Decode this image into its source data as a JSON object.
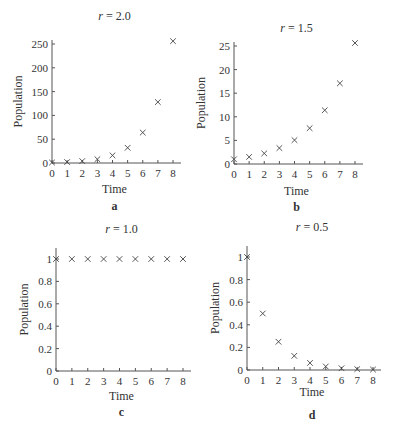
{
  "chart_data": [
    {
      "type": "scatter",
      "panel": "a",
      "title": "r = 2.0",
      "title_var": "r",
      "title_value": "= 2.0",
      "xlabel": "Time",
      "ylabel": "Population",
      "x": [
        0,
        1,
        2,
        3,
        4,
        5,
        6,
        7,
        8
      ],
      "values": [
        1,
        2,
        4,
        8,
        16,
        32,
        64,
        128,
        256
      ],
      "xticks": [
        "0",
        "1",
        "2",
        "3",
        "4",
        "5",
        "6",
        "7",
        "8"
      ],
      "yticks": [
        "0",
        "50",
        "100",
        "150",
        "200",
        "250"
      ],
      "xlim": [
        0,
        8.4
      ],
      "ylim": [
        0,
        260
      ],
      "marker": "x",
      "grid": false,
      "legend": false
    },
    {
      "type": "scatter",
      "panel": "b",
      "title": "r = 1.5",
      "title_var": "r",
      "title_value": "= 1.5",
      "xlabel": "Time",
      "ylabel": "Population",
      "x": [
        0,
        1,
        2,
        3,
        4,
        5,
        6,
        7,
        8
      ],
      "values": [
        1,
        1.5,
        2.25,
        3.375,
        5.06,
        7.59,
        11.39,
        17.09,
        25.63
      ],
      "xticks": [
        "0",
        "1",
        "2",
        "3",
        "4",
        "5",
        "6",
        "7",
        "8"
      ],
      "yticks": [
        "0",
        "5",
        "10",
        "15",
        "20",
        "25"
      ],
      "xlim": [
        0,
        8.4
      ],
      "ylim": [
        0,
        26
      ],
      "marker": "x",
      "grid": false,
      "legend": false
    },
    {
      "type": "scatter",
      "panel": "c",
      "title": "r = 1.0",
      "title_var": "r",
      "title_value": "= 1.0",
      "xlabel": "Time",
      "ylabel": "Population",
      "x": [
        0,
        1,
        2,
        3,
        4,
        5,
        6,
        7,
        8
      ],
      "values": [
        1,
        1,
        1,
        1,
        1,
        1,
        1,
        1,
        1
      ],
      "xticks": [
        "0",
        "1",
        "2",
        "3",
        "4",
        "5",
        "6",
        "7",
        "8"
      ],
      "yticks": [
        "0",
        "0.2",
        "0.4",
        "0.6",
        "0.8",
        "1"
      ],
      "xlim": [
        0,
        8.4
      ],
      "ylim": [
        0,
        1.1
      ],
      "marker": "x",
      "grid": false,
      "legend": false
    },
    {
      "type": "scatter",
      "panel": "d",
      "title": "r = 0.5",
      "title_var": "r",
      "title_value": "= 0.5",
      "xlabel": "Time",
      "ylabel": "Population",
      "x": [
        0,
        1,
        2,
        3,
        4,
        5,
        6,
        7,
        8
      ],
      "values": [
        1,
        0.5,
        0.25,
        0.125,
        0.0625,
        0.03125,
        0.0156,
        0.0078,
        0.0039
      ],
      "xticks": [
        "0",
        "1",
        "2",
        "3",
        "4",
        "5",
        "6",
        "7",
        "8"
      ],
      "yticks": [
        "0",
        "0.2",
        "0.4",
        "0.6",
        "0.8",
        "1"
      ],
      "xlim": [
        0,
        8.4
      ],
      "ylim": [
        0,
        1.1
      ],
      "marker": "x",
      "grid": false,
      "legend": false
    }
  ],
  "panels": {
    "a": {
      "label": "a"
    },
    "b": {
      "label": "b"
    },
    "c": {
      "label": "c"
    },
    "d": {
      "label": "d"
    }
  },
  "colors": {
    "axis": "#555555",
    "marker": "#444444",
    "text": "#333333"
  }
}
